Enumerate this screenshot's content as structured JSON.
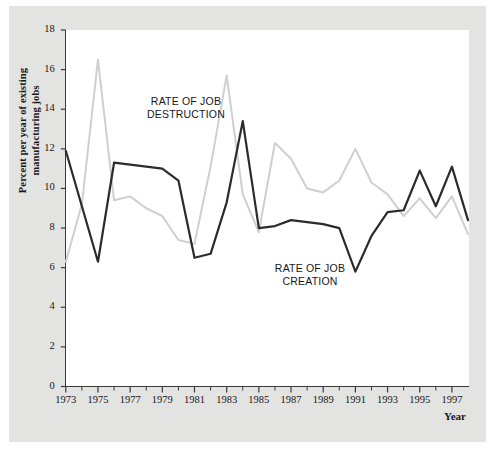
{
  "figure": {
    "background_color": "#e3e3e1",
    "plot_background_color": "#ffffff",
    "axis_color": "#3a3a3a"
  },
  "axis": {
    "y_title_line1": "Percent per year of existing",
    "y_title_line2": "manufacturing jobs",
    "x_title": "Year",
    "y_ticks": [
      "0",
      "2",
      "4",
      "6",
      "8",
      "10",
      "12",
      "14",
      "16",
      "18"
    ],
    "x_ticks": [
      "1973",
      "1975",
      "1977",
      "1979",
      "1981",
      "1983",
      "1985",
      "1987",
      "1989",
      "1991",
      "1993",
      "1995",
      "1997"
    ]
  },
  "annotations": {
    "destruction_line1": "RATE OF JOB",
    "destruction_line2": "DESTRUCTION",
    "creation_line1": "RATE OF JOB",
    "creation_line2": "CREATION"
  },
  "chart_data": {
    "type": "line",
    "title": "",
    "xlabel": "Year",
    "ylabel": "Percent per year of existing manufacturing jobs",
    "xlim": [
      1973,
      1998
    ],
    "ylim": [
      0,
      18
    ],
    "ytick_step": 2,
    "xtick_step": 1,
    "xtick_label_step": 2,
    "grid": false,
    "legend": "inline-annotations",
    "x": [
      1973,
      1974,
      1975,
      1976,
      1977,
      1978,
      1979,
      1980,
      1981,
      1982,
      1983,
      1984,
      1985,
      1986,
      1987,
      1988,
      1989,
      1990,
      1991,
      1992,
      1993,
      1994,
      1995,
      1996,
      1997,
      1998
    ],
    "series": [
      {
        "name": "RATE OF JOB DESTRUCTION",
        "color": "#cfcfcf",
        "values": [
          6.3,
          9.2,
          16.5,
          9.4,
          9.6,
          9.0,
          8.6,
          7.4,
          7.2,
          11.1,
          15.7,
          9.7,
          7.8,
          12.3,
          11.5,
          10.0,
          9.8,
          10.4,
          12.0,
          10.3,
          9.7,
          8.6,
          9.5,
          8.5,
          9.6,
          7.7
        ]
      },
      {
        "name": "RATE OF JOB CREATION",
        "color": "#2b2b2b",
        "values": [
          11.9,
          9.1,
          6.3,
          11.3,
          11.2,
          11.1,
          11.0,
          10.4,
          6.5,
          6.7,
          9.3,
          13.4,
          8.0,
          8.1,
          8.4,
          8.3,
          8.2,
          8.0,
          5.8,
          7.6,
          8.8,
          8.9,
          10.9,
          9.1,
          11.1,
          8.4
        ]
      }
    ]
  }
}
